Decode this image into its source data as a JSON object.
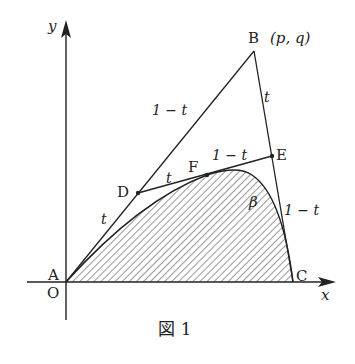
{
  "figure": {
    "caption": "図 1",
    "axes": {
      "x_label": "x",
      "y_label": "y",
      "origin_label": "O"
    },
    "points": {
      "A": {
        "label": "A"
      },
      "B": {
        "label": "B",
        "coords": "(p, q)"
      },
      "C": {
        "label": "C"
      },
      "D": {
        "label": "D"
      },
      "E": {
        "label": "E"
      },
      "F": {
        "label": "F"
      }
    },
    "segment_labels": {
      "AD": "t",
      "DB": "1 − t",
      "BE": "t",
      "EC": "1 − t",
      "DF": "t",
      "FE": "1 − t"
    },
    "curve_label": "β",
    "colors": {
      "ink": "#222222",
      "background": "#ffffff"
    }
  }
}
